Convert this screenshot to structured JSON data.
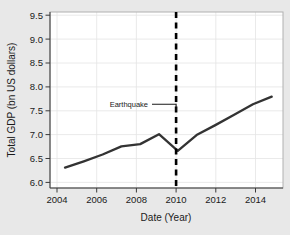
{
  "chart_data": {
    "type": "line",
    "title": "",
    "xlabel": "Date (Year)",
    "ylabel": "Total GDP (bn US dollars)",
    "xlim": [
      2003.2,
      2015.6
    ],
    "ylim": [
      5.83,
      9.72
    ],
    "grid": true,
    "legend": null,
    "x": [
      2004,
      2005,
      2006,
      2007,
      2008,
      2009,
      2010,
      2011,
      2012,
      2013,
      2014,
      2015
    ],
    "values": [
      6.28,
      6.42,
      6.57,
      6.75,
      6.8,
      7.02,
      6.65,
      7.0,
      7.22,
      7.45,
      7.68,
      7.85
    ],
    "series": [
      {
        "name": "Total GDP",
        "color": "#333333",
        "values": [
          6.28,
          6.42,
          6.57,
          6.75,
          6.8,
          7.02,
          6.65,
          7.0,
          7.22,
          7.45,
          7.68,
          7.85
        ]
      }
    ],
    "xticks": [
      2004,
      2006,
      2008,
      2010,
      2012,
      2014
    ],
    "xtick_labels": [
      "2004",
      "2006",
      "2008",
      "2010",
      "2012",
      "2014"
    ],
    "yticks": [
      6.0,
      6.5,
      7.0,
      7.5,
      8.0,
      8.5,
      9.0,
      9.5
    ],
    "ytick_labels": [
      "6.0",
      "6.5",
      "7.0",
      "7.5",
      "8.0",
      "8.5",
      "9.0",
      "9.5"
    ],
    "annotations": [
      {
        "text": "Earthquake",
        "x": 2010,
        "type": "vertical-dashed-line-with-label",
        "label_y": 7.62,
        "line_color": "#000000",
        "line_style": "dashed"
      }
    ],
    "colors": {
      "figure_background": "#e8e8e8",
      "plot_background": "#ffffff",
      "gridline": "#e4e4e4",
      "data_line": "#333333",
      "event_line": "#000000",
      "text": "#1a1a1a"
    }
  }
}
